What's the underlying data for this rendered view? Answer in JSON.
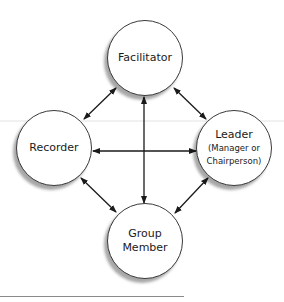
{
  "diagram": {
    "nodes": [
      {
        "id": "facilitator",
        "label": "Facilitator",
        "sub": null
      },
      {
        "id": "recorder",
        "label": "Recorder",
        "sub": null
      },
      {
        "id": "leader",
        "label": "Leader",
        "sub_line1": "(Manager or",
        "sub_line2": "Chairperson)"
      },
      {
        "id": "group-member",
        "label_line1": "Group",
        "label_line2": "Member"
      }
    ],
    "edges": [
      {
        "from": "facilitator",
        "to": "recorder",
        "type": "bidirectional"
      },
      {
        "from": "facilitator",
        "to": "leader",
        "type": "bidirectional"
      },
      {
        "from": "facilitator",
        "to": "group-member",
        "type": "bidirectional"
      },
      {
        "from": "recorder",
        "to": "leader",
        "type": "bidirectional"
      },
      {
        "from": "recorder",
        "to": "group-member",
        "type": "bidirectional"
      },
      {
        "from": "leader",
        "to": "group-member",
        "type": "bidirectional"
      }
    ],
    "colors": {
      "stroke": "#1a1a1a",
      "node_fill": "#ffffff",
      "shadow": "#7a7a7a"
    }
  }
}
